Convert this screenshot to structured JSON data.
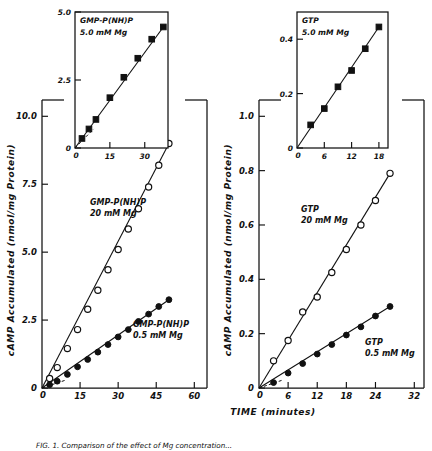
{
  "figure": {
    "caption_partial": "FIG. 1.  Comparison of the effect of Mg concentration...",
    "x_axis_title": "TIME   (minutes)"
  },
  "panels": [
    {
      "id": "left",
      "y_axis_title": "cAMP Accumulated  (nmol/mg Protein)",
      "y_ticks": [
        "0",
        "2.5",
        "5.0",
        "7.5",
        "10.0"
      ],
      "x_ticks": [
        "0",
        "15",
        "30",
        "45",
        "60"
      ],
      "y_values": [
        0,
        2.5,
        5.0,
        7.5,
        10.0
      ],
      "x_values": [
        0,
        15,
        30,
        45,
        60
      ],
      "origin_label": "0",
      "annotations": [
        {
          "name": "upper-series-label",
          "line1": "GMP-P(NH)P",
          "line2": "20 mM  Mg"
        },
        {
          "name": "lower-series-label",
          "line1": "GMP-P(NH)P",
          "line2": "0.5 mM Mg"
        }
      ],
      "inset": {
        "title_line1": "GMP-P(NH)P",
        "title_line2": "5.0  mM Mg",
        "y_ticks": [
          "0",
          "2.5",
          "5.0"
        ],
        "x_ticks": [
          "0",
          "15",
          "30"
        ],
        "y_values": [
          0,
          2.5,
          5.0
        ],
        "x_values": [
          0,
          15,
          30
        ],
        "origin_label": "0"
      }
    },
    {
      "id": "right",
      "y_axis_title": "cAMP Accumulated  (nmol/mg Protein)",
      "y_ticks": [
        "0",
        "0.2",
        "0.4",
        "0.6",
        "0.8",
        "1.0"
      ],
      "x_ticks": [
        "0",
        "6",
        "12",
        "18",
        "24",
        "32"
      ],
      "y_values": [
        0,
        0.2,
        0.4,
        0.6,
        0.8,
        1.0
      ],
      "x_values": [
        0,
        6,
        12,
        18,
        24,
        32
      ],
      "origin_label": "0",
      "annotations": [
        {
          "name": "upper-series-label",
          "line1": "GTP",
          "line2": "20 mM  Mg"
        },
        {
          "name": "lower-series-label",
          "line1": "GTP",
          "line2": "0.5 mM Mg"
        }
      ],
      "inset": {
        "title_line1": "GTP",
        "title_line2": "5.0 mM Mg",
        "y_ticks": [
          "0",
          "0.2",
          "0.4"
        ],
        "x_ticks": [
          "0",
          "6",
          "12",
          "18"
        ],
        "y_values": [
          0,
          0.2,
          0.4
        ],
        "x_values": [
          0,
          6,
          12,
          18
        ],
        "origin_label": "0"
      }
    }
  ],
  "chart_data": [
    {
      "type": "line",
      "panel": "left-main",
      "title": "GMP-P(NH)P cAMP accumulation",
      "xlabel": "TIME (minutes)",
      "ylabel": "cAMP Accumulated (nmol/mg Protein)",
      "xlim": [
        0,
        65
      ],
      "ylim": [
        0,
        10.6
      ],
      "grid": false,
      "legend": "inline-annotation",
      "series": [
        {
          "name": "GMP-P(NH)P 20 mM Mg",
          "marker": "open-circle",
          "x": [
            3,
            6,
            10,
            14,
            18,
            22,
            26,
            30,
            34,
            38,
            42,
            46,
            50
          ],
          "y": [
            0.35,
            0.75,
            1.45,
            2.15,
            2.9,
            3.6,
            4.35,
            5.1,
            5.85,
            6.6,
            7.4,
            8.2,
            9.0
          ]
        },
        {
          "name": "GMP-P(NH)P 0.5 mM Mg",
          "marker": "filled-circle",
          "x": [
            3,
            6,
            10,
            14,
            18,
            22,
            26,
            30,
            34,
            38,
            42,
            46,
            50
          ],
          "y": [
            0.12,
            0.25,
            0.5,
            0.78,
            1.05,
            1.32,
            1.6,
            1.88,
            2.15,
            2.45,
            2.72,
            3.0,
            3.25
          ]
        }
      ]
    },
    {
      "type": "line",
      "panel": "left-inset",
      "title": "GMP-P(NH)P 5.0 mM Mg",
      "xlabel": "",
      "ylabel": "",
      "xlim": [
        0,
        40
      ],
      "ylim": [
        0,
        5.0
      ],
      "grid": false,
      "series": [
        {
          "name": "GMP-P(NH)P 5.0 mM Mg",
          "marker": "filled-square",
          "x": [
            3,
            6,
            9,
            15,
            21,
            27,
            33,
            38
          ],
          "y": [
            0.35,
            0.7,
            1.05,
            1.85,
            2.6,
            3.3,
            4.0,
            4.45
          ]
        }
      ]
    },
    {
      "type": "line",
      "panel": "right-main",
      "title": "GTP cAMP accumulation",
      "xlabel": "TIME (minutes)",
      "ylabel": "cAMP Accumulated (nmol/mg Protein)",
      "xlim": [
        0,
        34
      ],
      "ylim": [
        0,
        1.06
      ],
      "grid": false,
      "legend": "inline-annotation",
      "series": [
        {
          "name": "GTP 20 mM Mg",
          "marker": "open-circle",
          "x": [
            3,
            6,
            9,
            12,
            15,
            18,
            21,
            24,
            27
          ],
          "y": [
            0.1,
            0.175,
            0.28,
            0.335,
            0.425,
            0.51,
            0.6,
            0.69,
            0.79
          ]
        },
        {
          "name": "GTP 0.5 mM Mg",
          "marker": "filled-circle",
          "x": [
            3,
            6,
            9,
            12,
            15,
            18,
            21,
            24,
            27
          ],
          "y": [
            0.02,
            0.055,
            0.09,
            0.125,
            0.16,
            0.195,
            0.225,
            0.265,
            0.3
          ]
        }
      ]
    },
    {
      "type": "line",
      "panel": "right-inset",
      "title": "GTP 5.0 mM Mg",
      "xlabel": "",
      "ylabel": "",
      "xlim": [
        0,
        20
      ],
      "ylim": [
        0,
        0.5
      ],
      "grid": false,
      "series": [
        {
          "name": "GTP 5.0 mM Mg",
          "marker": "filled-square",
          "x": [
            3,
            6,
            9,
            12,
            15,
            18
          ],
          "y": [
            0.085,
            0.145,
            0.225,
            0.285,
            0.365,
            0.445
          ]
        }
      ]
    }
  ]
}
